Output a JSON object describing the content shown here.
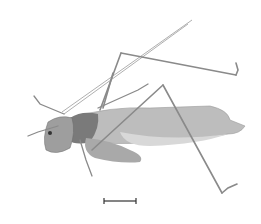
{
  "image": {
    "subject": "katydid specimen, lateral view",
    "background": "#ffffff",
    "body_color": "#b8b8b8",
    "dark_color": "#4a4a4a",
    "leg_color": "#8a8a8a"
  },
  "scale_bar": {
    "x1": 104,
    "x2": 136,
    "y": 201,
    "color": "#333333",
    "label": ""
  }
}
